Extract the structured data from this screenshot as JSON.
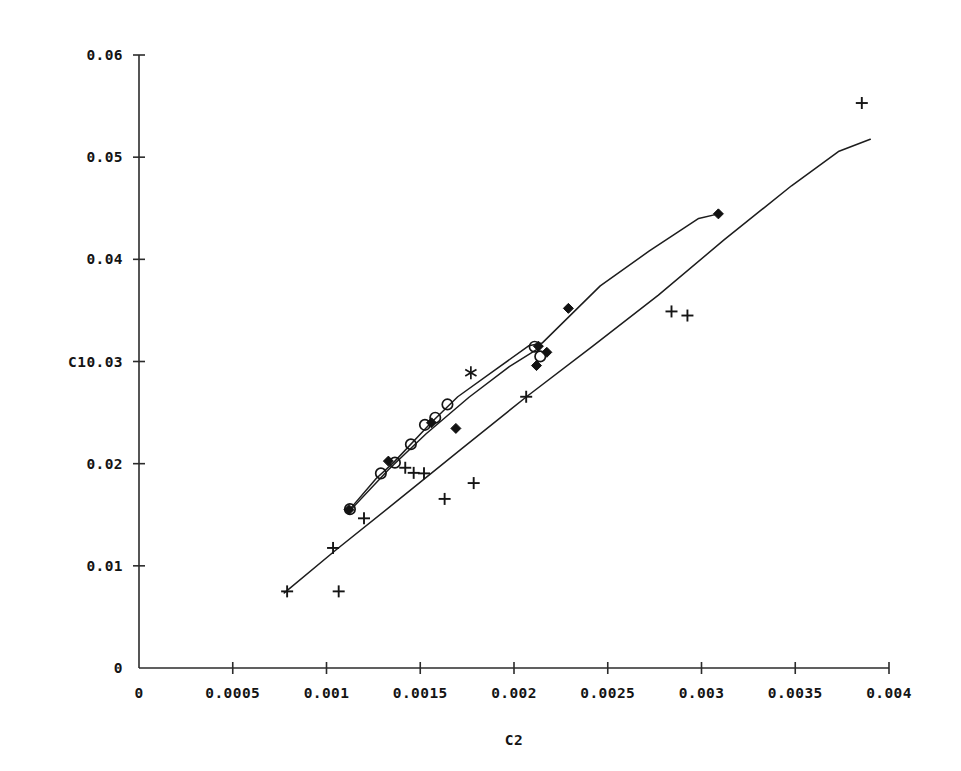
{
  "chart_data": {
    "type": "scatter",
    "title": "",
    "subtitle": "",
    "xlabel": "C2",
    "ylabel": "C1",
    "xlim": [
      0,
      0.004
    ],
    "ylim": [
      0,
      0.06
    ],
    "grid": false,
    "legend": "none",
    "x_ticks": [
      0,
      0.0005,
      0.001,
      0.0015,
      0.002,
      0.0025,
      0.003,
      0.0035,
      0.004
    ],
    "x_tick_labels": [
      "0",
      "0.0005",
      "0.001",
      "0.0015",
      "0.002",
      "0.0025",
      "0.003",
      "0.0035",
      "0.004"
    ],
    "y_ticks": [
      0,
      0.01,
      0.02,
      0.03,
      0.04,
      0.05,
      0.06
    ],
    "y_tick_labels": [
      "0",
      "0.01",
      "0.02",
      "0.03",
      "0.04",
      "0.05",
      "0.06"
    ],
    "ylabel_anchor_tick": "0.03",
    "series": [
      {
        "name": "upper-fitted-line",
        "type": "line",
        "marker": "none",
        "points": [
          [
            0.001125,
            0.01555
          ],
          [
            0.001265,
            0.01855
          ],
          [
            0.00136,
            0.02015
          ],
          [
            0.001555,
            0.02395
          ],
          [
            0.0017,
            0.02655
          ],
          [
            0.001905,
            0.02925
          ],
          [
            0.00208,
            0.03155
          ],
          [
            0.00215,
            0.0318
          ],
          [
            0.00246,
            0.0374
          ],
          [
            0.00272,
            0.0408
          ],
          [
            0.002985,
            0.044
          ],
          [
            0.00309,
            0.04445
          ]
        ]
      },
      {
        "name": "secondary-fitted-line",
        "type": "line",
        "marker": "none",
        "points": [
          [
            0.00113,
            0.0155
          ],
          [
            0.00133,
            0.0194
          ],
          [
            0.00153,
            0.0229
          ],
          [
            0.00176,
            0.0265
          ],
          [
            0.001975,
            0.0295
          ],
          [
            0.00215,
            0.0315
          ]
        ]
      },
      {
        "name": "lower-fitted-line",
        "type": "line",
        "marker": "none",
        "points": [
          [
            0.000775,
            0.00735
          ],
          [
            0.00105,
            0.01155
          ],
          [
            0.00138,
            0.0164
          ],
          [
            0.00172,
            0.02145
          ],
          [
            0.00207,
            0.0266
          ],
          [
            0.00242,
            0.0315
          ],
          [
            0.00277,
            0.0365
          ],
          [
            0.00312,
            0.0419
          ],
          [
            0.00348,
            0.0472
          ],
          [
            0.00373,
            0.05055
          ],
          [
            0.0039,
            0.05175
          ]
        ]
      },
      {
        "name": "open-circle-points",
        "type": "scatter",
        "marker": "circle-open",
        "points": [
          [
            0.001125,
            0.01555
          ],
          [
            0.00129,
            0.01905
          ],
          [
            0.001365,
            0.0201
          ],
          [
            0.00145,
            0.0219
          ],
          [
            0.001525,
            0.0238
          ],
          [
            0.00158,
            0.0245
          ],
          [
            0.001645,
            0.0258
          ],
          [
            0.00211,
            0.03145
          ],
          [
            0.00214,
            0.0305
          ]
        ]
      },
      {
        "name": "filled-diamond-points",
        "type": "scatter",
        "marker": "diamond-filled",
        "points": [
          [
            0.00112,
            0.0155
          ],
          [
            0.00133,
            0.02025
          ],
          [
            0.00156,
            0.024
          ],
          [
            0.00169,
            0.02345
          ],
          [
            0.00213,
            0.0315
          ],
          [
            0.002175,
            0.0309
          ],
          [
            0.00212,
            0.0296
          ],
          [
            0.00229,
            0.0352
          ],
          [
            0.00309,
            0.04445
          ]
        ]
      },
      {
        "name": "asterisk-points",
        "type": "scatter",
        "marker": "asterisk",
        "points": [
          [
            0.00177,
            0.0289
          ]
        ]
      },
      {
        "name": "plus-points",
        "type": "scatter",
        "marker": "plus",
        "points": [
          [
            0.00079,
            0.0075
          ],
          [
            0.001065,
            0.0075
          ],
          [
            0.001035,
            0.01175
          ],
          [
            0.0012,
            0.01465
          ],
          [
            0.00142,
            0.0196
          ],
          [
            0.001465,
            0.0191
          ],
          [
            0.00152,
            0.01905
          ],
          [
            0.00163,
            0.01655
          ],
          [
            0.001785,
            0.0181
          ],
          [
            0.002065,
            0.02655
          ],
          [
            0.00284,
            0.0349
          ],
          [
            0.002925,
            0.0345
          ],
          [
            0.003855,
            0.0553
          ]
        ]
      }
    ]
  }
}
